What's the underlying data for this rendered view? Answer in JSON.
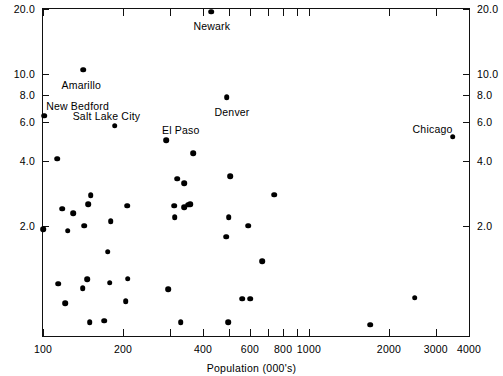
{
  "chart_data": {
    "type": "scatter",
    "title": "",
    "xlabel": "Population (000's)",
    "ylabel": "Percent of city area",
    "xscale": "log",
    "yscale": "log",
    "xlim": [
      100,
      4000
    ],
    "ylim": [
      0.62,
      20.0
    ],
    "grid": false,
    "legend": "none",
    "xticks": [
      {
        "value": 100,
        "label": "100"
      },
      {
        "value": 200,
        "label": "200"
      },
      {
        "value": 300,
        "label": ""
      },
      {
        "value": 400,
        "label": "400"
      },
      {
        "value": 500,
        "label": ""
      },
      {
        "value": 600,
        "label": "600"
      },
      {
        "value": 700,
        "label": ""
      },
      {
        "value": 800,
        "label": "800"
      },
      {
        "value": 900,
        "label": ""
      },
      {
        "value": 1000,
        "label": "1000"
      },
      {
        "value": 2000,
        "label": "2000"
      },
      {
        "value": 3000,
        "label": "3000"
      },
      {
        "value": 4000,
        "label": "4000"
      }
    ],
    "yticks": [
      {
        "value": 20.0,
        "label": "20.0"
      },
      {
        "value": 10.0,
        "label": "10.0"
      },
      {
        "value": 8.0,
        "label": "8.0"
      },
      {
        "value": 6.0,
        "label": "6.0"
      },
      {
        "value": 4.0,
        "label": "4.0"
      },
      {
        "value": 2.0,
        "label": "2.0"
      }
    ],
    "points": [
      {
        "x": 430,
        "y": 19.4,
        "label": "Newark",
        "lx": -18,
        "ly": 8
      },
      {
        "x": 142,
        "y": 10.5,
        "label": "Amarillo",
        "lx": -22,
        "ly": 9
      },
      {
        "x": 101,
        "y": 6.45,
        "label": "New Bedford",
        "lx": 2,
        "ly": -16
      },
      {
        "x": 490,
        "y": 7.85,
        "label": "Denver",
        "lx": -12,
        "ly": 9
      },
      {
        "x": 186,
        "y": 5.8,
        "label": "Salt Lake City",
        "lx": -42,
        "ly": -16
      },
      {
        "x": 290,
        "y": 4.95,
        "label": "El Paso",
        "lx": -4,
        "ly": -16
      },
      {
        "x": 3470,
        "y": 5.15,
        "label": "Chicago",
        "lx": -40,
        "ly": -14
      },
      {
        "x": 368,
        "y": 4.33,
        "label": null
      },
      {
        "x": 113,
        "y": 4.08,
        "label": null
      },
      {
        "x": 505,
        "y": 3.38,
        "label": null
      },
      {
        "x": 319,
        "y": 3.29,
        "label": null
      },
      {
        "x": 340,
        "y": 3.15,
        "label": null
      },
      {
        "x": 742,
        "y": 2.78,
        "label": null
      },
      {
        "x": 151,
        "y": 2.76,
        "label": null
      },
      {
        "x": 148,
        "y": 2.52,
        "label": null
      },
      {
        "x": 207,
        "y": 2.47,
        "label": null
      },
      {
        "x": 311,
        "y": 2.47,
        "label": null
      },
      {
        "x": 351,
        "y": 2.5,
        "label": null
      },
      {
        "x": 358,
        "y": 2.52,
        "label": null
      },
      {
        "x": 339,
        "y": 2.44,
        "label": null
      },
      {
        "x": 118,
        "y": 2.4,
        "label": null
      },
      {
        "x": 130,
        "y": 2.29,
        "label": null
      },
      {
        "x": 313,
        "y": 2.19,
        "label": null
      },
      {
        "x": 500,
        "y": 2.19,
        "label": null
      },
      {
        "x": 180,
        "y": 2.1,
        "label": null
      },
      {
        "x": 100,
        "y": 1.93,
        "label": null
      },
      {
        "x": 143,
        "y": 2.0,
        "label": null
      },
      {
        "x": 590,
        "y": 2.0,
        "label": null
      },
      {
        "x": 124,
        "y": 1.9,
        "label": null
      },
      {
        "x": 489,
        "y": 1.78,
        "label": null
      },
      {
        "x": 175,
        "y": 1.52,
        "label": null
      },
      {
        "x": 668,
        "y": 1.37,
        "label": null
      },
      {
        "x": 147,
        "y": 1.13,
        "label": null
      },
      {
        "x": 208,
        "y": 1.14,
        "label": null
      },
      {
        "x": 178,
        "y": 1.09,
        "label": null
      },
      {
        "x": 114,
        "y": 1.08,
        "label": null
      },
      {
        "x": 141,
        "y": 1.03,
        "label": null
      },
      {
        "x": 296,
        "y": 1.02,
        "label": null
      },
      {
        "x": 2500,
        "y": 0.93,
        "label": null
      },
      {
        "x": 560,
        "y": 0.92,
        "label": null
      },
      {
        "x": 600,
        "y": 0.92,
        "label": null
      },
      {
        "x": 205,
        "y": 0.9,
        "label": null
      },
      {
        "x": 121,
        "y": 0.88,
        "label": null
      },
      {
        "x": 150,
        "y": 0.72,
        "label": null
      },
      {
        "x": 170,
        "y": 0.73,
        "label": null
      },
      {
        "x": 330,
        "y": 0.72,
        "label": null
      },
      {
        "x": 498,
        "y": 0.72,
        "label": null
      },
      {
        "x": 1700,
        "y": 0.7,
        "label": null
      }
    ]
  }
}
